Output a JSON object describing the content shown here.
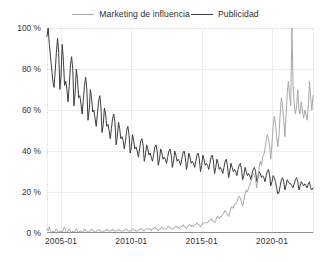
{
  "legend": {
    "position": "top-center",
    "entries": [
      {
        "label": "Marketing de influencia",
        "color": "#a8a8a8",
        "swatch": "line-swatch"
      },
      {
        "label": "Publicidad",
        "color": "#3c3c3c",
        "swatch": "line-swatch"
      }
    ]
  },
  "chart_data": {
    "type": "line",
    "title": "",
    "xlabel": "",
    "ylabel": "",
    "grid": true,
    "legend_position": "top-center",
    "ylim": [
      0,
      100
    ],
    "yticks": [
      0,
      20,
      40,
      60,
      80,
      100
    ],
    "ytick_labels": [
      "0 %",
      "20 %",
      "40 %",
      "60 %",
      "80 %",
      "100 %"
    ],
    "xlim": [
      "2004-01",
      "2022-09"
    ],
    "xticks": [
      "2005-01",
      "2010-01",
      "2015-01",
      "2020-01"
    ],
    "xtick_labels": [
      "2005-01",
      "2010-01",
      "2015-01",
      "2020-01"
    ],
    "x_start_year": 2004,
    "x_start_month": 1,
    "x_step_months": 1,
    "series": [
      {
        "name": "Publicidad",
        "color": "#3c3c3c",
        "width": 1.0,
        "values": [
          96,
          100,
          92,
          86,
          80,
          74,
          71,
          79,
          88,
          95,
          88,
          70,
          77,
          92,
          84,
          72,
          74,
          70,
          64,
          72,
          82,
          86,
          80,
          62,
          68,
          80,
          75,
          66,
          67,
          63,
          58,
          65,
          72,
          76,
          70,
          55,
          60,
          70,
          66,
          59,
          60,
          56,
          52,
          58,
          64,
          67,
          62,
          49,
          53,
          61,
          58,
          52,
          53,
          50,
          46,
          51,
          56,
          58,
          54,
          43,
          47,
          54,
          51,
          46,
          47,
          45,
          41,
          45,
          50,
          52,
          48,
          39,
          42,
          48,
          45,
          41,
          42,
          40,
          37,
          41,
          45,
          46,
          43,
          35,
          38,
          43,
          41,
          38,
          39,
          37,
          35,
          38,
          42,
          43,
          40,
          33,
          36,
          41,
          39,
          36,
          37,
          36,
          34,
          37,
          40,
          41,
          38,
          32,
          35,
          40,
          38,
          35,
          36,
          35,
          33,
          36,
          39,
          40,
          37,
          31,
          34,
          39,
          37,
          34,
          35,
          34,
          32,
          35,
          38,
          39,
          36,
          30,
          33,
          38,
          36,
          33,
          34,
          33,
          31,
          34,
          37,
          38,
          35,
          29,
          32,
          36,
          34,
          31,
          32,
          31,
          29,
          32,
          35,
          36,
          33,
          27,
          30,
          34,
          32,
          30,
          31,
          30,
          28,
          31,
          33,
          34,
          31,
          26,
          28,
          32,
          30,
          28,
          29,
          28,
          26,
          29,
          31,
          32,
          30,
          25,
          27,
          30,
          29,
          27,
          28,
          27,
          25,
          28,
          30,
          31,
          28,
          23,
          25,
          28,
          27,
          25,
          22,
          19,
          20,
          23,
          26,
          27,
          25,
          21,
          23,
          26,
          25,
          24,
          24,
          23,
          22,
          24,
          26,
          27,
          25,
          21,
          23,
          25,
          24,
          23,
          24,
          23,
          22,
          24,
          25,
          22,
          21,
          22
        ]
      },
      {
        "name": "Marketing de influencia",
        "color": "#a8a8a8",
        "width": 1.0,
        "values": [
          2,
          1,
          3,
          1,
          0,
          1,
          0,
          1,
          2,
          1,
          0,
          1,
          1,
          0,
          2,
          3,
          1,
          0,
          1,
          2,
          1,
          0,
          1,
          0,
          1,
          2,
          1,
          0,
          1,
          1,
          0,
          1,
          2,
          1,
          1,
          0,
          1,
          1,
          2,
          1,
          1,
          0,
          1,
          1,
          2,
          1,
          1,
          0,
          1,
          1,
          1,
          2,
          1,
          1,
          1,
          1,
          2,
          1,
          1,
          1,
          1,
          2,
          1,
          1,
          1,
          1,
          1,
          2,
          2,
          1,
          1,
          1,
          1,
          2,
          2,
          1,
          1,
          1,
          1,
          2,
          2,
          2,
          1,
          1,
          2,
          2,
          2,
          2,
          2,
          1,
          2,
          2,
          3,
          2,
          2,
          1,
          2,
          2,
          3,
          2,
          2,
          2,
          2,
          3,
          3,
          3,
          2,
          2,
          2,
          3,
          3,
          3,
          3,
          2,
          3,
          3,
          4,
          3,
          3,
          2,
          3,
          4,
          4,
          3,
          4,
          3,
          4,
          4,
          5,
          4,
          4,
          3,
          4,
          5,
          5,
          5,
          5,
          5,
          6,
          6,
          7,
          6,
          6,
          5,
          6,
          8,
          8,
          7,
          8,
          8,
          9,
          10,
          11,
          10,
          9,
          8,
          10,
          12,
          13,
          12,
          14,
          14,
          15,
          17,
          18,
          17,
          15,
          13,
          16,
          19,
          21,
          20,
          22,
          23,
          25,
          27,
          29,
          28,
          26,
          22,
          27,
          32,
          35,
          33,
          37,
          38,
          41,
          45,
          48,
          46,
          42,
          36,
          44,
          52,
          57,
          53,
          47,
          42,
          48,
          58,
          66,
          62,
          55,
          47,
          57,
          68,
          74,
          67,
          62,
          100,
          72,
          63,
          58,
          62,
          70,
          60,
          58,
          64,
          60,
          56,
          60,
          58,
          55,
          62,
          74,
          66,
          60,
          67
        ]
      }
    ]
  }
}
